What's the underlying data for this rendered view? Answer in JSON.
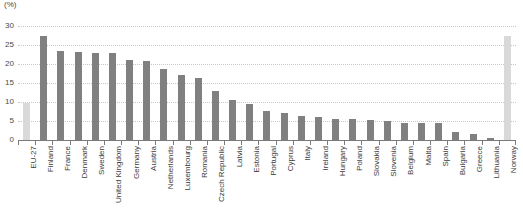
{
  "chart_data": {
    "type": "bar",
    "title": "",
    "subtitle": "",
    "xlabel": "",
    "ylabel": "",
    "unit_label": "(%)",
    "ylim": [
      0,
      30
    ],
    "yticks": [
      0,
      5,
      10,
      15,
      20,
      25,
      30
    ],
    "ytick_labels": [
      "0",
      "5",
      "10",
      "15",
      "20",
      "25",
      "30"
    ],
    "grid": true,
    "legend": "none",
    "orientation": "vertical",
    "label_rotation": -90,
    "categories": [
      "EU-27",
      "Finland",
      "France",
      "Denmark",
      "Sweden",
      "United Kingdom",
      "Germany",
      "Austria",
      "Netherlands",
      "Luxembourg",
      "Romania",
      "Czech Republic",
      "Latvia",
      "Estonia",
      "Portugal",
      "Cyprus",
      "Italy",
      "Ireland",
      "Hungary",
      "Poland",
      "Slovakia",
      "Slovenia",
      "Belgium",
      "Malta",
      "Spain",
      "Bulgaria",
      "Greece",
      "Lithuania",
      "Norway"
    ],
    "values": [
      9.8,
      27.5,
      23.4,
      23.2,
      23.0,
      22.9,
      21.0,
      20.8,
      18.8,
      17.2,
      16.2,
      13.0,
      10.6,
      9.6,
      7.6,
      7.0,
      6.3,
      6.0,
      5.6,
      5.5,
      5.3,
      5.0,
      4.6,
      4.5,
      4.4,
      2.0,
      1.5,
      0.5,
      27.3
    ],
    "highlight_indices": [
      0,
      28
    ],
    "colors": {
      "bar": "#808080",
      "bar_highlight": "#d9d9d9",
      "gridline": "#c8c8c8",
      "axis": "#7a7a7a",
      "text": "#3b3b3b"
    }
  }
}
